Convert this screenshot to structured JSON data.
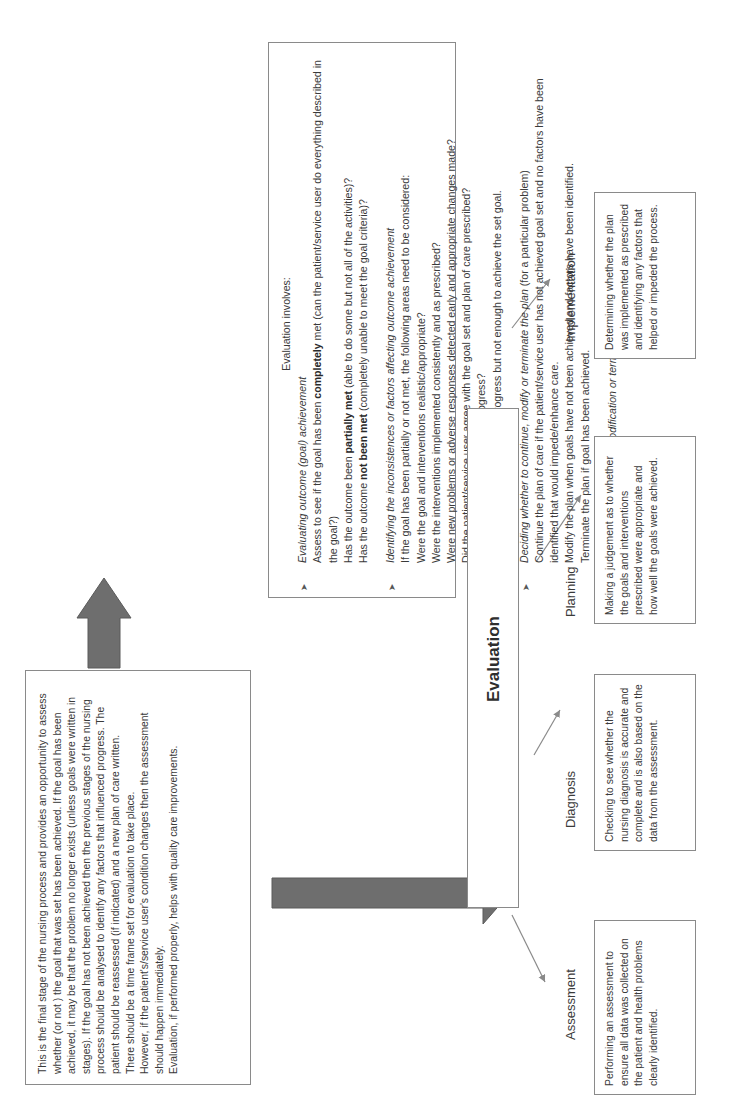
{
  "diagram": {
    "orientation": "rotated 90 degrees counter-clockwise",
    "center_node": {
      "title": "Evaluation"
    },
    "intro_box": {
      "paragraphs": [
        "This is the final stage of the nursing process and provides an opportunity to assess whether (or not ) the goal that was set has been achieved. If the goal has been achieved, it may be that the problem no longer exists (unless goals were written in stages). If the goal has not been achieved then the previous stages of the nursing process should be analysed to identify any factors that influenced progress. The patient should be reassessed (if indicated) and a new plan of care written.",
        "There should be a time frame set for evaluation to take place.",
        "However, if the patient's/service user's condition changes then the assessment should happen immediately.",
        "Evaluation, if performed properly, helps with quality care improvements."
      ]
    },
    "evaluation_involves_box": {
      "heading": "Evaluation involves:",
      "sections": [
        {
          "title": "Evaluating outcome (goal) achievement",
          "lines": [
            {
              "pre": "Assess to see if the goal has been ",
              "bold": "completely",
              "post": " met (can the patient/service user do everything described in the goal?)"
            },
            {
              "pre": "Has the outcome been ",
              "bold": "partially met",
              "post": " (able to do some but not all of the activities)?"
            },
            {
              "pre": "Has the outcome ",
              "bold": "not been met",
              "post": " (completely unable to meet the goal criteria)?"
            }
          ]
        },
        {
          "title": "Identifying the inconsistences or factors affecting outcome achievement",
          "lines": [
            {
              "pre": "If the goal has been partially or not met, the following areas need to be considered:",
              "bold": "",
              "post": ""
            },
            {
              "pre": "Were the goal and interventions realistic/appropriate?",
              "bold": "",
              "post": ""
            },
            {
              "pre": "Were the interventions implemented consistently and as prescribed?",
              "bold": "",
              "post": ""
            },
            {
              "pre": "Were new problems or adverse responses detected early and appropriate changes made?",
              "bold": "",
              "post": ""
            },
            {
              "pre": "Did the patient/service user agree with the goal set and plan of care prescribed?",
              "bold": "",
              "post": ""
            },
            {
              "pre": "How did these factors impede progress?",
              "bold": "",
              "post": ""
            },
            {
              "pre": "Or there may have been some progress but not enough to achieve the set goal.",
              "bold": "",
              "post": ""
            }
          ]
        },
        {
          "title": "Deciding whether to continue, modify or terminate the plan",
          "title_suffix": " (for a particular problem)",
          "lines": [
            {
              "pre": "Continue the plan of care if the patient/service user has not achieved goal set and no factors have been identified that would impede/enhance care.",
              "bold": "",
              "post": ""
            },
            {
              "pre": "Modify the plan when goals have not been achieved and factors have been identified.",
              "bold": "",
              "post": ""
            },
            {
              "pre": "Terminate the plan if goal has been achieved.",
              "bold": "",
              "post": ""
            }
          ]
        },
        {
          "title": "The actual continuation, modification or termination of the care plan",
          "lines": []
        }
      ]
    },
    "stages": [
      {
        "label": "Assessment",
        "description": "Performing an assessment to ensure all data was collected on the patient and health problems clearly identified."
      },
      {
        "label": "Diagnosis",
        "description": "Checking to see whether the nursing diagnosis is accurate and complete and is also based on the data from the assessment."
      },
      {
        "label": "Planning",
        "description": "Making a judgement as to whether the goals and interventions prescribed were appropriate and how well the goals were achieved."
      },
      {
        "label": "Implementation",
        "description": "Determining whether the plan was implemented as prescribed and identifying any factors that helped or impeded the process."
      }
    ],
    "colors": {
      "thick_arrow": "#6e6e6e",
      "thin_arrow": "#8a8a8a",
      "box_border": "#8a8a8a",
      "text": "#3a3a3a"
    }
  }
}
